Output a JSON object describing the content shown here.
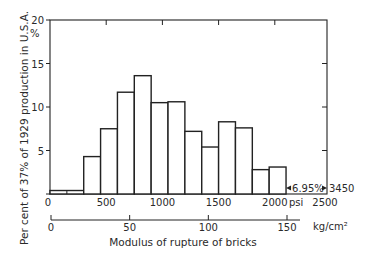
{
  "chart_data": {
    "type": "bar",
    "title": "",
    "xlabel": "Modulus of rupture of bricks",
    "ylabel": "Per cent of 37% of 1929 production in U.S.A.",
    "y_unit_label": "%",
    "ylim": [
      0,
      20
    ],
    "yticks": [
      0,
      5,
      10,
      15,
      20
    ],
    "x_primary": {
      "unit": "psi",
      "range": [
        0,
        2500
      ],
      "ticks": [
        0,
        500,
        1000,
        1500,
        2000,
        2500
      ]
    },
    "x_secondary": {
      "unit": "kg/cm²",
      "ticks": [
        0,
        50,
        100,
        150
      ]
    },
    "bins": [
      {
        "from": 0,
        "to": 300,
        "value": 0.4
      },
      {
        "from": 300,
        "to": 450,
        "value": 4.3
      },
      {
        "from": 450,
        "to": 600,
        "value": 7.5
      },
      {
        "from": 600,
        "to": 750,
        "value": 11.7
      },
      {
        "from": 750,
        "to": 900,
        "value": 13.6
      },
      {
        "from": 900,
        "to": 1050,
        "value": 10.5
      },
      {
        "from": 1050,
        "to": 1200,
        "value": 10.6
      },
      {
        "from": 1200,
        "to": 1350,
        "value": 7.2
      },
      {
        "from": 1350,
        "to": 1500,
        "value": 5.4
      },
      {
        "from": 1500,
        "to": 1650,
        "value": 8.3
      },
      {
        "from": 1650,
        "to": 1800,
        "value": 7.6
      },
      {
        "from": 1800,
        "to": 1950,
        "value": 2.8
      },
      {
        "from": 1950,
        "to": 2100,
        "value": 3.1
      }
    ],
    "annotation": {
      "text": "6.95%",
      "range_from": 2100,
      "range_to_label": "3450",
      "description": "6.95% of production between 2100 and 3450 psi"
    },
    "grid": false,
    "legend": null
  },
  "labels": {
    "y_unit": "%",
    "x_unit_psi": "psi",
    "x_unit_kg": "kg/cm²",
    "annotation_pct": "6.95%",
    "annotation_end": "3450",
    "xlabel": "Modulus of rupture of bricks",
    "ylabel": "Per cent of 37% of 1929 production in U.S.A."
  }
}
